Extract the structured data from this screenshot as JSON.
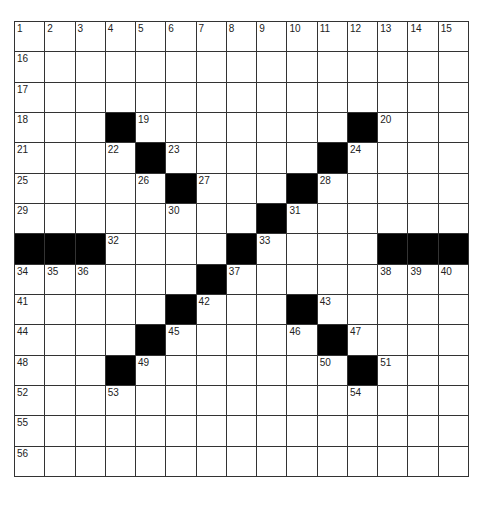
{
  "puzzle": {
    "rows": 15,
    "cols": 15,
    "colors": {
      "black": "#000000",
      "white": "#ffffff",
      "line": "#333333"
    },
    "grid": [
      ".......:.......",
      "...............",
      "...............",
      "...#.......#...",
      "....#.....#....",
      ".....#...#.....",
      "........#......",
      "###....#....###",
      "......#........",
      ".....#...#.....",
      "....#.....#....",
      "...#.......#...",
      "...............",
      "...............",
      "..............."
    ],
    "numbers": [
      [
        1,
        2,
        3,
        4,
        5,
        6,
        7,
        8,
        9,
        10,
        11,
        12,
        13,
        14,
        15
      ],
      [
        16,
        0,
        0,
        0,
        0,
        0,
        0,
        0,
        0,
        0,
        0,
        0,
        0,
        0,
        0
      ],
      [
        17,
        0,
        0,
        0,
        0,
        0,
        0,
        0,
        0,
        0,
        0,
        0,
        0,
        0,
        0
      ],
      [
        18,
        0,
        0,
        0,
        19,
        0,
        0,
        0,
        0,
        0,
        0,
        0,
        20,
        0,
        0
      ],
      [
        21,
        0,
        0,
        22,
        0,
        23,
        0,
        0,
        0,
        0,
        0,
        24,
        0,
        0,
        0
      ],
      [
        25,
        0,
        0,
        0,
        26,
        0,
        27,
        0,
        0,
        0,
        28,
        0,
        0,
        0,
        0
      ],
      [
        29,
        0,
        0,
        0,
        0,
        30,
        0,
        0,
        0,
        31,
        0,
        0,
        0,
        0,
        0
      ],
      [
        0,
        0,
        0,
        32,
        0,
        0,
        0,
        0,
        33,
        0,
        0,
        0,
        0,
        0,
        0
      ],
      [
        34,
        35,
        36,
        0,
        0,
        0,
        0,
        37,
        0,
        0,
        0,
        0,
        38,
        39,
        40
      ],
      [
        41,
        0,
        0,
        0,
        0,
        0,
        42,
        0,
        0,
        0,
        43,
        0,
        0,
        0,
        0
      ],
      [
        44,
        0,
        0,
        0,
        0,
        45,
        0,
        0,
        0,
        46,
        0,
        47,
        0,
        0,
        0
      ],
      [
        48,
        0,
        0,
        0,
        49,
        0,
        0,
        0,
        0,
        0,
        50,
        0,
        51,
        0,
        0
      ],
      [
        52,
        0,
        0,
        53,
        0,
        0,
        0,
        0,
        0,
        0,
        0,
        54,
        0,
        0,
        0
      ],
      [
        55,
        0,
        0,
        0,
        0,
        0,
        0,
        0,
        0,
        0,
        0,
        0,
        0,
        0,
        0
      ],
      [
        56,
        0,
        0,
        0,
        0,
        0,
        0,
        0,
        0,
        0,
        0,
        0,
        0,
        0,
        0
      ]
    ]
  }
}
